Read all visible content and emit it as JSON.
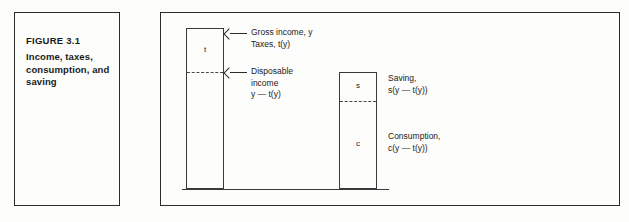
{
  "figure": {
    "number": "FIGURE 3.1",
    "title": "Income, taxes,\nconsumption, and\nsaving"
  },
  "diagram": {
    "bar_income": {
      "name": "gross income bar",
      "segments": [
        {
          "key": "t",
          "letter": "t",
          "meaning": "taxes"
        },
        {
          "key": "disposable",
          "letter": "",
          "meaning": "disposable income"
        }
      ]
    },
    "bar_disposable": {
      "name": "disposable income bar",
      "segments": [
        {
          "key": "s",
          "letter": "s",
          "meaning": "saving"
        },
        {
          "key": "c",
          "letter": "c",
          "meaning": "consumption"
        }
      ]
    },
    "callouts": [
      {
        "key": "gross_income",
        "text": "Gross income, y\nTaxes, t(y)"
      },
      {
        "key": "disposable_income",
        "text": "Disposable\nincome\ny — t(y)"
      }
    ],
    "side_labels": [
      {
        "key": "saving",
        "text": "Saving,\ns(y — t(y))"
      },
      {
        "key": "consumption",
        "text": "Consumption,\nc(y — t(y))"
      }
    ]
  },
  "chart_data": {
    "type": "bar",
    "title": "Income, taxes, consumption, and saving",
    "categories": [
      "Gross income, y",
      "Disposable income, y — t(y)"
    ],
    "series": [
      {
        "name": "Taxes, t(y)",
        "values": [
          44,
          0
        ]
      },
      {
        "name": "Disposable income, y — t(y)",
        "values": [
          117,
          0
        ]
      },
      {
        "name": "Saving, s(y — t(y))",
        "values": [
          0,
          29
        ]
      },
      {
        "name": "Consumption, c(y — t(y))",
        "values": [
          0,
          88
        ]
      }
    ],
    "xlabel": "",
    "ylabel": "",
    "grid": false,
    "legend": "none"
  }
}
